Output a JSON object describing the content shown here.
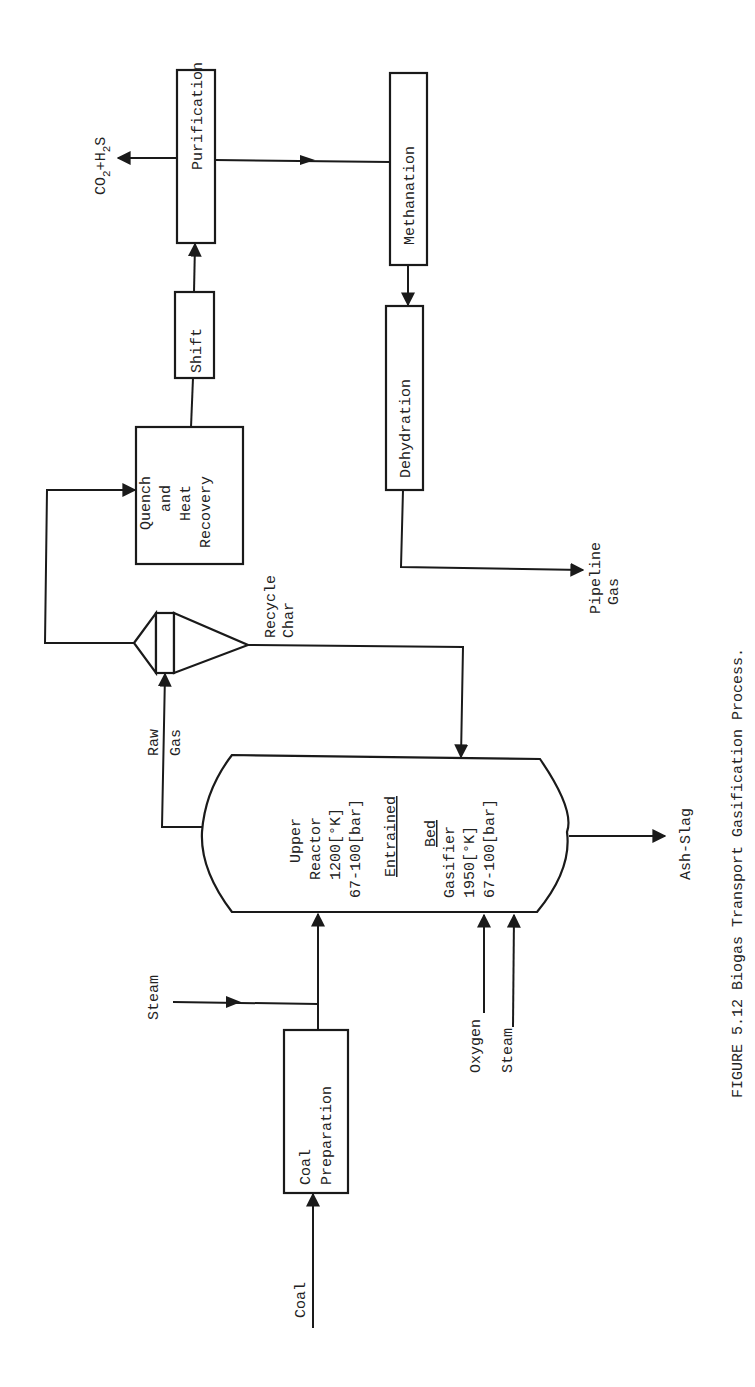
{
  "figure": {
    "caption": "FIGURE 5.12  Biogas Transport Gasification Process.",
    "orientation": "rotated 90 degrees counter-clockwise"
  },
  "units": {
    "purification": "Purification",
    "methanation": "Methanation",
    "dehydration": "Dehydration",
    "shift": "Shift",
    "quench": [
      "Quench",
      "and",
      "Heat",
      "Recovery"
    ],
    "coal_prep": [
      "Coal",
      "Preparation"
    ],
    "gasifier": {
      "upper": [
        "Upper",
        "Reactor",
        "1200[°K]",
        "67-100[bar]"
      ],
      "entrained": "Entrained",
      "bed": "Bed",
      "lower": [
        "Gasifier",
        "1950[°K]",
        "67-100[bar]"
      ]
    }
  },
  "streams": {
    "co2_h2s": {
      "main": "CO",
      "sub1": "2",
      "mid": "+H",
      "sub2": "2",
      "end": "S"
    },
    "pipeline_gas": [
      "Pipeline",
      "Gas"
    ],
    "recycle_char": [
      "Recycle",
      "Char"
    ],
    "raw_gas": [
      "Raw",
      "Gas"
    ],
    "ash_slag": "Ash-Slag",
    "steam_top": "Steam",
    "oxygen": "Oxygen",
    "steam_bottom": "Steam",
    "coal": "Coal"
  },
  "colors": {
    "line": "#1a1a1a",
    "text": "#222222",
    "background": "#ffffff"
  }
}
